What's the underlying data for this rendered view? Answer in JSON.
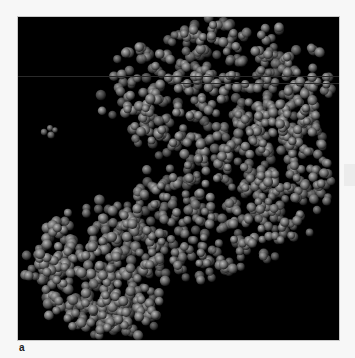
{
  "figure": {
    "panel_label": "a",
    "background": "#000000",
    "sphere_color_light": "#bdbdbd",
    "sphere_color_mid": "#6e6e6e",
    "sphere_color_dark": "#1c1c1c",
    "clusters": [
      {
        "name": "upper-right-domain",
        "cx": 200,
        "cy": 75,
        "rx": 110,
        "ry": 70,
        "count": 430,
        "r": [
          3.8,
          5.2
        ],
        "seed": 11
      },
      {
        "name": "upper-right-tail",
        "cx": 270,
        "cy": 150,
        "rx": 45,
        "ry": 70,
        "count": 160,
        "r": [
          3.8,
          5.0
        ],
        "seed": 21
      },
      {
        "name": "center-bridge",
        "cx": 190,
        "cy": 200,
        "rx": 80,
        "ry": 60,
        "count": 260,
        "r": [
          3.8,
          5.0
        ],
        "seed": 31
      },
      {
        "name": "lower-left-domain",
        "cx": 80,
        "cy": 250,
        "rx": 68,
        "ry": 60,
        "count": 300,
        "r": [
          4.0,
          5.4
        ],
        "seed": 41
      },
      {
        "name": "lower-bottom",
        "cx": 100,
        "cy": 300,
        "rx": 40,
        "ry": 22,
        "count": 70,
        "r": [
          4.0,
          5.2
        ],
        "seed": 51
      }
    ],
    "isolated_group": [
      {
        "x": 26,
        "y": 115,
        "r": 3.2
      },
      {
        "x": 32,
        "y": 111,
        "r": 3.0
      },
      {
        "x": 33,
        "y": 118,
        "r": 3.6
      },
      {
        "x": 37,
        "y": 113,
        "r": 2.8
      }
    ],
    "scanlines": [
      {
        "y": 59,
        "x": 0,
        "w": 321
      },
      {
        "y": 66,
        "x": 150,
        "w": 171
      }
    ]
  }
}
